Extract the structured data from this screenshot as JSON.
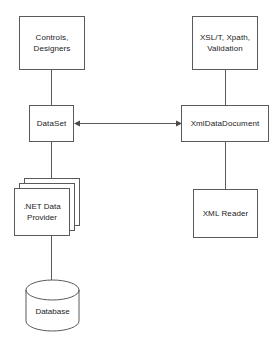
{
  "diagram": {
    "type": "architecture-block-diagram",
    "background_color": "#ffffff",
    "line_color": "#5a5a5a",
    "text_color": "#1b1b1b",
    "nodes": [
      {
        "id": "controls-designers",
        "label": "Controls,\nDesigners",
        "shape": "rectangle",
        "x": 19,
        "y": 16,
        "w": 66,
        "h": 54
      },
      {
        "id": "xslt-xpath-validation",
        "label": "XSL/T, Xpath,\nValidation",
        "shape": "rectangle",
        "x": 192,
        "y": 16,
        "w": 66,
        "h": 54
      },
      {
        "id": "dataset",
        "label": "DataSet",
        "shape": "rectangle",
        "x": 29,
        "y": 105,
        "w": 45,
        "h": 37
      },
      {
        "id": "xmldatadocument",
        "label": "XmlDataDocument",
        "shape": "rectangle",
        "x": 181,
        "y": 105,
        "w": 88,
        "h": 37
      },
      {
        "id": "net-data-provider",
        "label": ".NET Data\nProvider",
        "shape": "stacked-rectangle",
        "x": 14,
        "y": 178,
        "w": 56,
        "h": 58
      },
      {
        "id": "xml-reader",
        "label": "XML Reader",
        "shape": "rectangle",
        "x": 193,
        "y": 189,
        "w": 65,
        "h": 49
      },
      {
        "id": "database",
        "label": "Database",
        "shape": "cylinder",
        "x": 25,
        "y": 279,
        "w": 55,
        "h": 53
      }
    ],
    "edges": [
      {
        "id": "controls-to-dataset",
        "from": "controls-designers",
        "to": "dataset",
        "style": "line",
        "arrow": "none"
      },
      {
        "id": "xslt-to-xmldatadocument",
        "from": "xslt-xpath-validation",
        "to": "xmldatadocument",
        "style": "line",
        "arrow": "none"
      },
      {
        "id": "dataset-to-xmldatadocument",
        "from": "dataset",
        "to": "xmldatadocument",
        "style": "line",
        "arrow": "both"
      },
      {
        "id": "dataset-to-provider",
        "from": "dataset",
        "to": "net-data-provider",
        "style": "line",
        "arrow": "none"
      },
      {
        "id": "provider-to-database",
        "from": "net-data-provider",
        "to": "database",
        "style": "line",
        "arrow": "none"
      },
      {
        "id": "xmldatadocument-to-xmlreader",
        "from": "xmldatadocument",
        "to": "xml-reader",
        "style": "line",
        "arrow": "none"
      }
    ]
  },
  "labels": {
    "controls_designers": "Controls,\nDesigners",
    "xslt_xpath_validation": "XSL/T, Xpath,\nValidation",
    "dataset": "DataSet",
    "xmldatadocument": "XmlDataDocument",
    "net_data_provider": ".NET Data\nProvider",
    "xml_reader": "XML Reader",
    "database": "Database"
  }
}
